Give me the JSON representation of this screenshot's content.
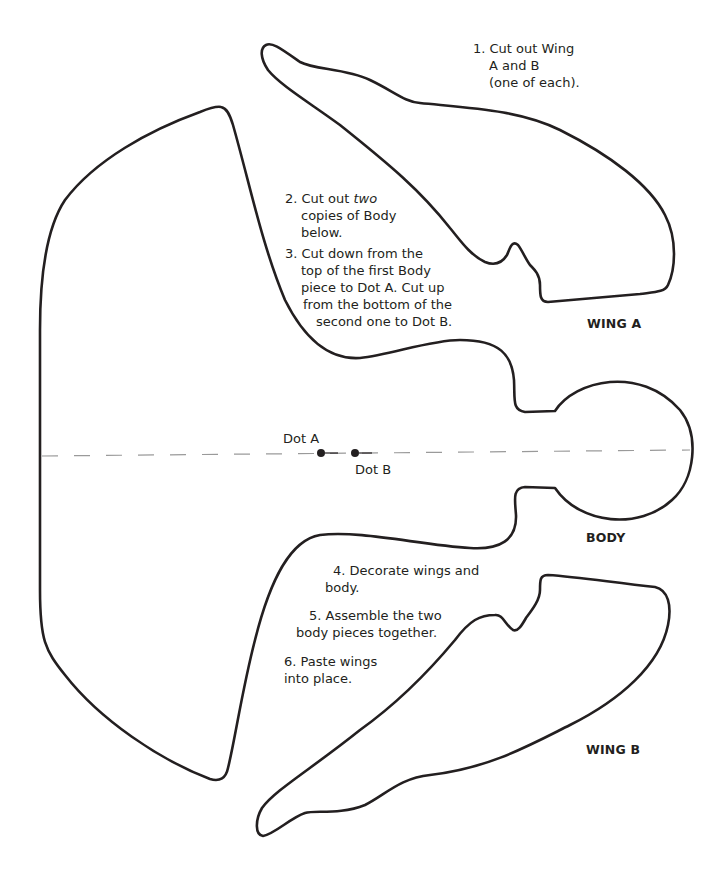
{
  "pieces": {
    "wing_a": {
      "label": "WING A"
    },
    "wing_b": {
      "label": "WING B"
    },
    "body": {
      "label": "BODY"
    }
  },
  "dots": {
    "dot_a": {
      "label": "Dot A"
    },
    "dot_b": {
      "label": "Dot B"
    }
  },
  "instructions": {
    "step1": {
      "line1": "1. Cut out Wing",
      "line2": "A and B",
      "line3": "(one of each)."
    },
    "step2": {
      "prefix": "2. Cut out ",
      "emphasis": "two",
      "line2": "copies of Body",
      "line3": "below."
    },
    "step3": {
      "line1": "3. Cut down from the",
      "line2": "top of the first Body",
      "line3": "piece to Dot A. Cut up",
      "line4": "from the bottom of the",
      "line5": "second one to Dot B."
    },
    "step4": {
      "line1": "4. Decorate wings and",
      "line2": "body."
    },
    "step5": {
      "line1": "5. Assemble the two",
      "line2": "body pieces together."
    },
    "step6": {
      "line1": "6. Paste wings",
      "line2": "into place."
    }
  },
  "colors": {
    "outline": "#231f20",
    "fold_line": "#9a9a9a"
  }
}
